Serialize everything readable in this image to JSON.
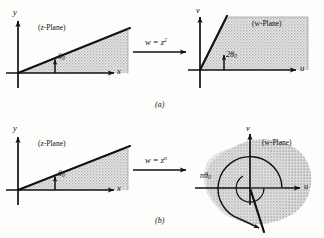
{
  "figure": {
    "caption_a": "(a)",
    "caption_b": "(b)",
    "panels": [
      {
        "id": "panel-a-source",
        "plane_label": "(z-Plane)",
        "axis_x": "x",
        "axis_y": "y",
        "angle_label": "θ0",
        "angle_label_text": "θ",
        "angle_label_sub": "0",
        "angle_degrees": 22,
        "region": "sector"
      },
      {
        "id": "panel-a-target",
        "plane_label": "(w-Plane)",
        "axis_x": "u",
        "axis_y": "v",
        "angle_label_text": "2θ",
        "angle_label_sub": "0",
        "angle_degrees": 63,
        "region": "sector"
      },
      {
        "id": "panel-b-source",
        "plane_label": "(z-Plane)",
        "axis_x": "x",
        "axis_y": "y",
        "angle_label_text": "θ",
        "angle_label_sub": "0",
        "angle_degrees": 22,
        "region": "sector"
      },
      {
        "id": "panel-b-target",
        "plane_label": "(w-Plane)",
        "axis_x": "u",
        "axis_y": "v",
        "angle_label_text": "nθ",
        "angle_label_sub": "0",
        "angle_degrees": 290,
        "region": "overlapping-blob"
      }
    ],
    "transform_a": {
      "lhs": "w",
      "eq": "=",
      "rhs_base": "z",
      "rhs_exp": "2"
    },
    "transform_b": {
      "lhs": "w",
      "eq": "=",
      "rhs_base": "z",
      "rhs_exp": "n"
    },
    "colors": {
      "ink": "#111111",
      "shade": "#b9b9b9",
      "paper": "#fdfdfc"
    }
  }
}
